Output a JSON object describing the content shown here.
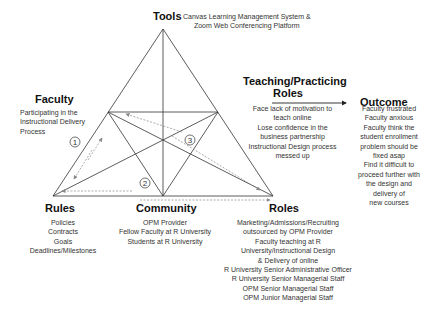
{
  "tools": {
    "title": "Tools",
    "lines": [
      "Canvas Learning Management System &",
      "Zoom Web Conferencing Platform"
    ]
  },
  "faculty": {
    "title": "Faculty",
    "lines": [
      "Participating in the",
      "Instructional Delivery",
      "Process"
    ]
  },
  "teaching_roles": {
    "title_lines": [
      "Teaching/Practicing",
      "Roles"
    ],
    "lines": [
      "Face lack of motivation to",
      "teach online",
      "Lose confidence in the",
      "business partnership",
      "Instructional Design process",
      "messed up"
    ]
  },
  "outcome": {
    "title": "Outcome",
    "lines": [
      "Faculty frustrated",
      "Faculty anxious",
      "Faculty think the",
      "student enrollment",
      "problem should be",
      "fixed asap",
      "Find it difficult to",
      "proceed further with",
      "the design and",
      "delivery of",
      "new courses"
    ]
  },
  "rules": {
    "title": "Rules",
    "lines": [
      "Policies",
      "Contracts",
      "Goals",
      "Deadlines/Milestones"
    ]
  },
  "community": {
    "title": "Community",
    "lines": [
      "OPM Provider",
      "Fellow Faculty at R University",
      "Students at R University"
    ]
  },
  "roles": {
    "title": "Roles",
    "lines": [
      "Marketing/Admissions/Recruiting",
      "outsourced by OPM Provider",
      "Faculty teaching at R",
      "University/Instructional Design",
      "& Delivery of online",
      "R University Senior Administrative Officer",
      "R University Senior Managerial Staff",
      "OPM Senior Managerial Staff",
      "OPM Junior Managerial Staff"
    ]
  },
  "markers": [
    "1",
    "2",
    "3"
  ],
  "colors": {
    "line": "#333333",
    "dashed_arrow": "#888888"
  }
}
